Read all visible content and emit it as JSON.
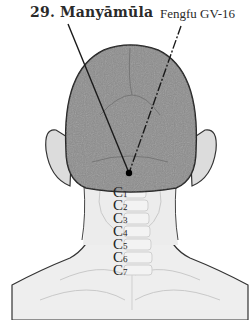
{
  "labels": {
    "point_title": "29. Manyāmūla",
    "reference_point": "Fengfu GV-16"
  },
  "vertebrae": [
    {
      "letter": "C",
      "num": "1"
    },
    {
      "letter": "C",
      "num": "2"
    },
    {
      "letter": "C",
      "num": "3"
    },
    {
      "letter": "C",
      "num": "4"
    },
    {
      "letter": "C",
      "num": "5"
    },
    {
      "letter": "C",
      "num": "6"
    },
    {
      "letter": "C",
      "num": "7"
    }
  ],
  "colors": {
    "head": "#8c8c8c",
    "skin": "#ededed",
    "outline": "#333333",
    "line": "#1a1a1a",
    "point": "#000000"
  }
}
